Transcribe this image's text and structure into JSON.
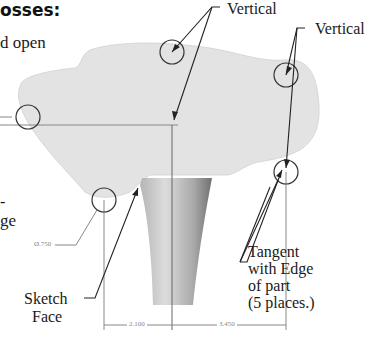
{
  "heading": "osses:",
  "body_fragments": {
    "line1": "d open",
    "frag_a": "-",
    "frag_b": "ge"
  },
  "callouts": {
    "vertical_top": "Vertical",
    "vertical_right": "Vertical",
    "tangent": [
      "Tangent",
      "with Edge",
      "of part",
      "(5 places.)"
    ],
    "sketch_face": [
      "Sketch",
      "Face"
    ]
  },
  "dimensions": {
    "diameter": "Ø.750",
    "left_width": "2.100",
    "right_width": "3.450"
  },
  "colors": {
    "part_fill": "#e3e3e3",
    "stem_fill": "#c4c4c4",
    "line": "#222222",
    "dim_line": "#888888"
  }
}
